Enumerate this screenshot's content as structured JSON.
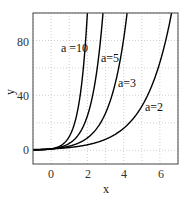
{
  "chart_data": {
    "type": "line",
    "title": "",
    "xlabel": "x",
    "ylabel": "y",
    "xlim": [
      -1,
      7
    ],
    "ylim": [
      -10,
      100
    ],
    "xticks": [
      0,
      2,
      4,
      6
    ],
    "yticks": [
      0,
      40,
      80
    ],
    "grid": true,
    "legend": "none (inline labels)",
    "function": "y = a^x",
    "series": [
      {
        "name": "a=10",
        "a": 10,
        "label_pos": [
          2.0,
          74
        ]
      },
      {
        "name": "a=5",
        "a": 5,
        "label_pos": [
          3.0,
          65
        ]
      },
      {
        "name": "a=3",
        "a": 3,
        "label_pos": [
          3.9,
          48
        ]
      },
      {
        "name": "a=2",
        "a": 2,
        "label_pos": [
          5.4,
          30
        ]
      }
    ]
  },
  "labels": {
    "xlabel": "x",
    "ylabel": "y",
    "a10": "a =10",
    "a5": "a=5",
    "a3": "a=3",
    "a2": "a=2",
    "xt0": "0",
    "xt1": "2",
    "xt2": "4",
    "xt3": "6",
    "yt0": "0",
    "yt1": "40",
    "yt2": "80"
  }
}
